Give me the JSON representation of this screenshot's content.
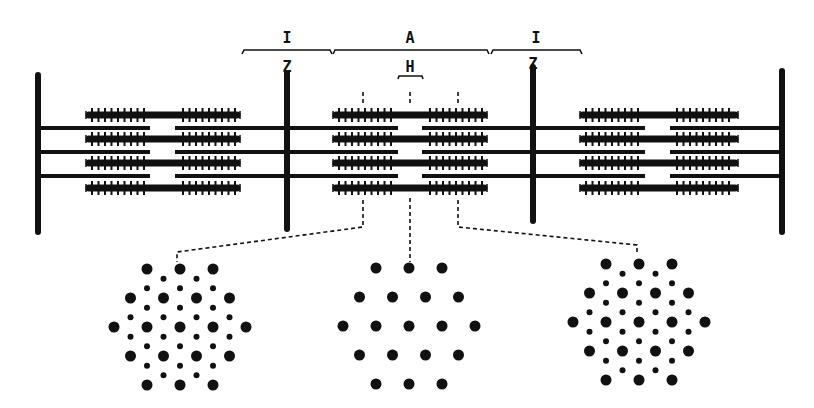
{
  "diagram": {
    "colors": {
      "ink": "#111111",
      "background": "#ffffff"
    },
    "band_labels": {
      "I_left": "I",
      "A": "A",
      "I_right": "I",
      "Z_left": "Z",
      "Z_right": "Z",
      "H": "H"
    },
    "z_lines_x": [
      38,
      287,
      533,
      782
    ],
    "thin_filament_rows_y": [
      128,
      152,
      176
    ],
    "thick_filament_rows_y": [
      115,
      139,
      163,
      188
    ],
    "thick_filament_groups": [
      {
        "x1": 86,
        "x2": 240,
        "gap_x1": 150,
        "gap_x2": 175
      },
      {
        "x1": 333,
        "x2": 487,
        "gap_x1": 398,
        "gap_x2": 422
      },
      {
        "x1": 580,
        "x2": 738,
        "gap_x1": 645,
        "gap_x2": 670
      }
    ],
    "cross_sections": [
      {
        "name": "overlap-region-left",
        "type": "thick+thin",
        "connector_from_x": 363,
        "target_x": 177
      },
      {
        "name": "h-zone",
        "type": "thick-only",
        "connector_from_x": 410,
        "target_x": 409
      },
      {
        "name": "overlap-region-right",
        "type": "thick+thin",
        "connector_from_x": 458,
        "target_x": 637
      }
    ]
  }
}
